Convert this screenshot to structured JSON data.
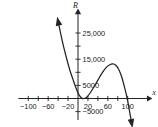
{
  "chart_data": {
    "type": "line",
    "title": "",
    "xlabel": "x",
    "ylabel": "R",
    "xlim": [
      -120,
      118
    ],
    "ylim": [
      -8000,
      29000
    ],
    "grid": false,
    "legend": null,
    "x_ticks": [
      {
        "value": -100,
        "label": "−100"
      },
      {
        "value": -80,
        "label": ""
      },
      {
        "value": -60,
        "label": "−60"
      },
      {
        "value": -40,
        "label": ""
      },
      {
        "value": -20,
        "label": "−20"
      },
      {
        "value": 20,
        "label": "20"
      },
      {
        "value": 40,
        "label": ""
      },
      {
        "value": 60,
        "label": "60"
      },
      {
        "value": 80,
        "label": ""
      },
      {
        "value": 100,
        "label": "100"
      }
    ],
    "y_ticks": [
      {
        "value": 25000,
        "label": "25,000"
      },
      {
        "value": 20000,
        "label": ""
      },
      {
        "value": 15000,
        "label": "15,000"
      },
      {
        "value": 10000,
        "label": ""
      },
      {
        "value": 5000,
        "label": "5000"
      },
      {
        "value": -5000,
        "label": "−5000"
      }
    ],
    "series": [
      {
        "name": "R(x)",
        "arrow_start": "up-left",
        "arrow_end": "down",
        "points": [
          {
            "x": -40,
            "y": 29500
          },
          {
            "x": -34,
            "y": 24000
          },
          {
            "x": -28,
            "y": 19000
          },
          {
            "x": -22,
            "y": 14600
          },
          {
            "x": -16,
            "y": 10600
          },
          {
            "x": -10,
            "y": 7200
          },
          {
            "x": -4,
            "y": 4000
          },
          {
            "x": 2,
            "y": 1400
          },
          {
            "x": 8,
            "y": 120
          },
          {
            "x": 12,
            "y": 0
          },
          {
            "x": 18,
            "y": 600
          },
          {
            "x": 24,
            "y": 2000
          },
          {
            "x": 32,
            "y": 4400
          },
          {
            "x": 40,
            "y": 7000
          },
          {
            "x": 48,
            "y": 9600
          },
          {
            "x": 56,
            "y": 11700
          },
          {
            "x": 64,
            "y": 12900
          },
          {
            "x": 70,
            "y": 13200
          },
          {
            "x": 76,
            "y": 12700
          },
          {
            "x": 82,
            "y": 11100
          },
          {
            "x": 88,
            "y": 8200
          },
          {
            "x": 94,
            "y": 4000
          },
          {
            "x": 99,
            "y": 0
          },
          {
            "x": 104,
            "y": -5200
          },
          {
            "x": 108,
            "y": -9500
          }
        ],
        "annotations": []
      }
    ]
  }
}
